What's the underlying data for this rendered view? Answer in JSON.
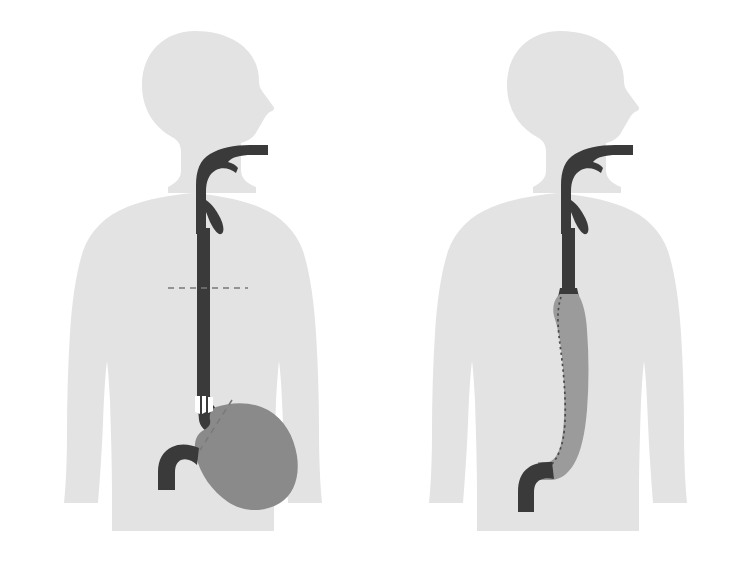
{
  "figure": {
    "width": 738,
    "height": 578,
    "background_color": "#ffffff",
    "type": "medical-illustration",
    "view": "anterior-torso-with-head-in-profile",
    "panel_count": 2
  },
  "palette": {
    "background": "#ffffff",
    "body_silhouette": "#e3e3e3",
    "esophagus_dark": "#3a3a3a",
    "duodenum_dark": "#3a3a3a",
    "stomach_gray": "#8a8a8a",
    "conduit_gray": "#9b9b9b",
    "resection_line": "#7a7a7a",
    "staple_line": "#4a4a4a",
    "cut_edge_white": "#ffffff"
  },
  "panels": [
    {
      "id": "left-panel",
      "name": "pre-resection",
      "label": "",
      "description": "Normal anatomy: full-length esophagus descending from pharynx to stomach, with planned resection levels marked by dashed lines.",
      "parts": [
        {
          "name": "body-silhouette",
          "color": "#e3e3e3"
        },
        {
          "name": "head-profile",
          "color": "#e3e3e3"
        },
        {
          "name": "pharynx-oral-cavity",
          "color": "#3a3a3a"
        },
        {
          "name": "esophagus",
          "color": "#3a3a3a"
        },
        {
          "name": "stomach",
          "color": "#8a8a8a"
        },
        {
          "name": "duodenum",
          "color": "#3a3a3a"
        },
        {
          "name": "proximal-resection-line",
          "color": "#7a7a7a",
          "style": "dashed-horizontal"
        },
        {
          "name": "distal-resection-line",
          "color": "#7a7a7a",
          "style": "dashed-oblique"
        },
        {
          "name": "transection-marks",
          "color": "#ffffff"
        }
      ]
    },
    {
      "id": "right-panel",
      "name": "post-reconstruction",
      "label": "",
      "description": "After esophagectomy: a tubularized gastric conduit is pulled up into the chest and anastomosed to the cervical esophageal remnant; a longitudinal staple line runs along the conduit.",
      "parts": [
        {
          "name": "body-silhouette",
          "color": "#e3e3e3"
        },
        {
          "name": "head-profile",
          "color": "#e3e3e3"
        },
        {
          "name": "pharynx-oral-cavity",
          "color": "#3a3a3a"
        },
        {
          "name": "cervical-esophagus-remnant",
          "color": "#3a3a3a"
        },
        {
          "name": "gastric-conduit",
          "color": "#9b9b9b"
        },
        {
          "name": "staple-line",
          "color": "#4a4a4a",
          "style": "dotted"
        },
        {
          "name": "duodenum",
          "color": "#3a3a3a"
        },
        {
          "name": "esophagogastric-anastomosis",
          "color": "#3a3a3a"
        }
      ]
    }
  ],
  "captions": {
    "left": "",
    "right": ""
  },
  "annotations": []
}
